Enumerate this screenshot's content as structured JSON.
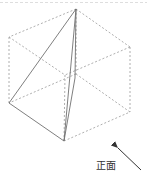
{
  "figure": {
    "type": "cube-with-inscribed-solid",
    "vertices": {
      "top": [
        76,
        9
      ],
      "upper_left": [
        9,
        37
      ],
      "upper_right": [
        130,
        47
      ],
      "front_top": [
        65,
        75
      ],
      "back_mid": [
        76,
        74
      ],
      "lower_left": [
        9,
        103
      ],
      "bottom": [
        64,
        141
      ],
      "lower_right": [
        130,
        112
      ]
    },
    "colors": {
      "dashed_edge": "#9a9a9a",
      "solid_edge": "#707070",
      "arrow": "#333333"
    }
  },
  "view_label": "正面"
}
